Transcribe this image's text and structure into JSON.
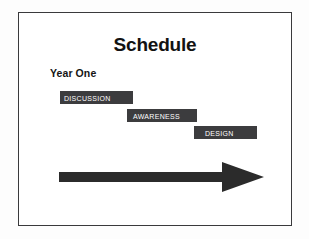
{
  "slide": {
    "title": "Schedule",
    "subtitle": "Year One",
    "background_color": "#ffffff",
    "border_color": "#3a3a3c",
    "bar_color": "#3c3c3e",
    "bar_text_color": "#ffffff",
    "arrow_color": "#2b2b2b"
  },
  "phases": [
    {
      "label": "Discussion",
      "left": 41,
      "top": 78,
      "width": 73,
      "height": 13,
      "label_offset": 4
    },
    {
      "label": "Awareness",
      "left": 108,
      "top": 96,
      "width": 70,
      "height": 13,
      "label_offset": 6
    },
    {
      "label": "Design",
      "left": 175,
      "top": 113,
      "width": 63,
      "height": 13,
      "label_offset": 11
    }
  ],
  "arrow": {
    "name": "timeline-arrow",
    "direction": "right",
    "shaft_length": 160,
    "shaft_thickness": 10,
    "head_length": 42,
    "head_height": 29
  }
}
